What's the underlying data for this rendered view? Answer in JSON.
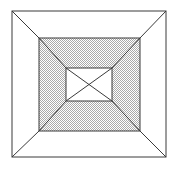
{
  "figure": {
    "title": "Nested squares perspective figure",
    "canvas": {
      "width": 178,
      "height": 169,
      "background": "#ffffff"
    },
    "style": {
      "stroke_color": "#3a3a3a",
      "stroke_width": 1,
      "shaded_fill": "#d2d2d2",
      "shade_pattern": "checker-dither",
      "white_fill": "#ffffff"
    },
    "shapes": [
      {
        "name": "outer-square",
        "kind": "rect",
        "x": 12,
        "y": 11,
        "width": 154,
        "height": 146,
        "fill": "#ffffff",
        "stroke": "#3a3a3a",
        "corners": [
          [
            12,
            11
          ],
          [
            166,
            11
          ],
          [
            166,
            157
          ],
          [
            12,
            157
          ]
        ]
      },
      {
        "name": "middle-square",
        "kind": "rect",
        "x": 39,
        "y": 38,
        "width": 101,
        "height": 93,
        "fill": "#d2d2d2",
        "stroke": "#3a3a3a",
        "corners": [
          [
            39,
            38
          ],
          [
            140,
            38
          ],
          [
            140,
            131
          ],
          [
            39,
            131
          ]
        ]
      },
      {
        "name": "inner-square",
        "kind": "rect",
        "x": 66,
        "y": 68,
        "width": 46,
        "height": 33,
        "fill": "#ffffff",
        "stroke": "#3a3a3a",
        "corners": [
          [
            66,
            68
          ],
          [
            112,
            68
          ],
          [
            112,
            101
          ],
          [
            66,
            101
          ]
        ]
      }
    ],
    "connectors": [
      {
        "name": "diagonal-outer-to-middle-top-left",
        "x1": 12,
        "y1": 11,
        "x2": 39,
        "y2": 38
      },
      {
        "name": "diagonal-outer-to-middle-top-right",
        "x1": 166,
        "y1": 11,
        "x2": 140,
        "y2": 38
      },
      {
        "name": "diagonal-outer-to-middle-bottom-right",
        "x1": 166,
        "y1": 157,
        "x2": 140,
        "y2": 131
      },
      {
        "name": "diagonal-outer-to-middle-bottom-left",
        "x1": 12,
        "y1": 157,
        "x2": 39,
        "y2": 131
      },
      {
        "name": "diagonal-middle-to-inner-top-left",
        "x1": 39,
        "y1": 38,
        "x2": 66,
        "y2": 68
      },
      {
        "name": "diagonal-middle-to-inner-top-right",
        "x1": 140,
        "y1": 38,
        "x2": 112,
        "y2": 68
      },
      {
        "name": "diagonal-middle-to-inner-bottom-right",
        "x1": 140,
        "y1": 131,
        "x2": 112,
        "y2": 101
      },
      {
        "name": "diagonal-middle-to-inner-bottom-left",
        "x1": 39,
        "y1": 131,
        "x2": 66,
        "y2": 101
      },
      {
        "name": "inner-diagonal-tl-br",
        "x1": 66,
        "y1": 68,
        "x2": 112,
        "y2": 101
      },
      {
        "name": "inner-diagonal-tr-bl",
        "x1": 112,
        "y1": 68,
        "x2": 66,
        "y2": 101
      }
    ]
  }
}
